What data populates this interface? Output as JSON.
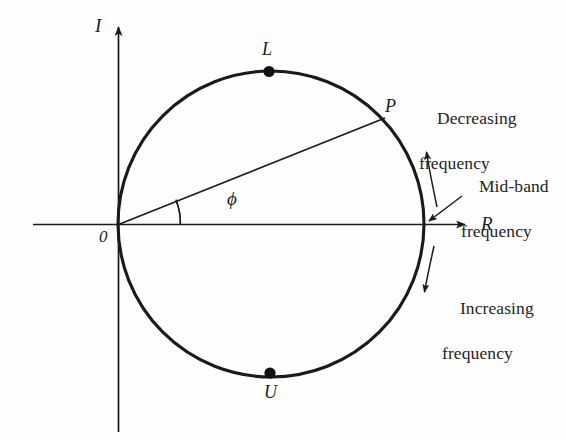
{
  "figure": {
    "type": "nyquist-polar-plot",
    "background_color": "#fefefe",
    "stroke_color": "#1a1a1a",
    "text_color": "#242424"
  },
  "axes": {
    "vertical": {
      "label": "I",
      "name": "imaginary-axis",
      "arrow": "up"
    },
    "horizontal": {
      "label": "R",
      "name": "real-axis",
      "arrow": "right"
    },
    "origin": {
      "label": "0"
    }
  },
  "circle": {
    "center_x": 271,
    "center_y": 224,
    "radius": 153
  },
  "points": [
    {
      "id": "L",
      "label": "L",
      "name": "point-l",
      "x": 269,
      "y": 72,
      "marker": "filled-dot"
    },
    {
      "id": "P",
      "label": "P",
      "name": "point-p",
      "x": 384,
      "y": 119,
      "marker": "none"
    },
    {
      "id": "U",
      "label": "U",
      "name": "point-u",
      "x": 270,
      "y": 374,
      "marker": "filled-dot"
    }
  ],
  "angle": {
    "symbol": "ϕ",
    "name": "phi-angle",
    "arc_radius": 62
  },
  "annotations": {
    "decreasing": {
      "line1": "Decreasing",
      "line2": "frequency"
    },
    "midband": {
      "line1": "Mid-band",
      "line2": "frequency"
    },
    "increasing": {
      "line1": "Increasing",
      "line2": "frequency"
    }
  }
}
